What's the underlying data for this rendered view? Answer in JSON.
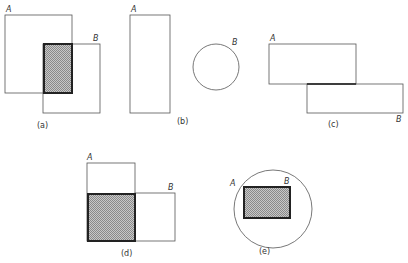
{
  "diagram": {
    "type": "set-relations-figure",
    "colors": {
      "stroke": "#555555",
      "shade_stroke": "#222222",
      "hatch": "#9a9a9a"
    },
    "panels": [
      {
        "id": "a",
        "caption": "(a)",
        "label_a": "A",
        "label_b": "B",
        "relation": "partial overlap (intersection shaded)"
      },
      {
        "id": "b",
        "caption": "(b)",
        "label_a": "A",
        "label_b": "B",
        "relation": "disjoint"
      },
      {
        "id": "c",
        "caption": "(c)",
        "label_a": "A",
        "label_b": "B",
        "relation": "touching along edge"
      },
      {
        "id": "d",
        "caption": "(d)",
        "label_a": "A",
        "label_b": "B",
        "relation": "shared region shaded, adjacent"
      },
      {
        "id": "e",
        "caption": "(e)",
        "label_a": "A",
        "label_b": "B",
        "relation": "B contained in A (shaded)"
      }
    ]
  }
}
